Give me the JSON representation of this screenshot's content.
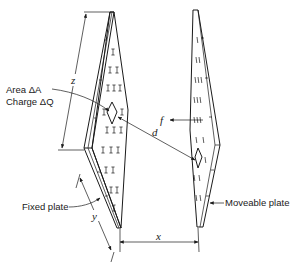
{
  "diagram": {
    "labels": {
      "area": "Area ΔA",
      "charge": "Charge ΔQ",
      "fixed_plate": "Fixed plate",
      "moveable_plate": "Moveable plate",
      "dim_z": "z",
      "dim_y": "y",
      "dim_x": "x",
      "dim_d": "d",
      "force": "f"
    },
    "fixed_plate_charge_symbol": "+",
    "moveable_plate_charge_symbol": "−",
    "line_color": "#1a1a1a"
  }
}
